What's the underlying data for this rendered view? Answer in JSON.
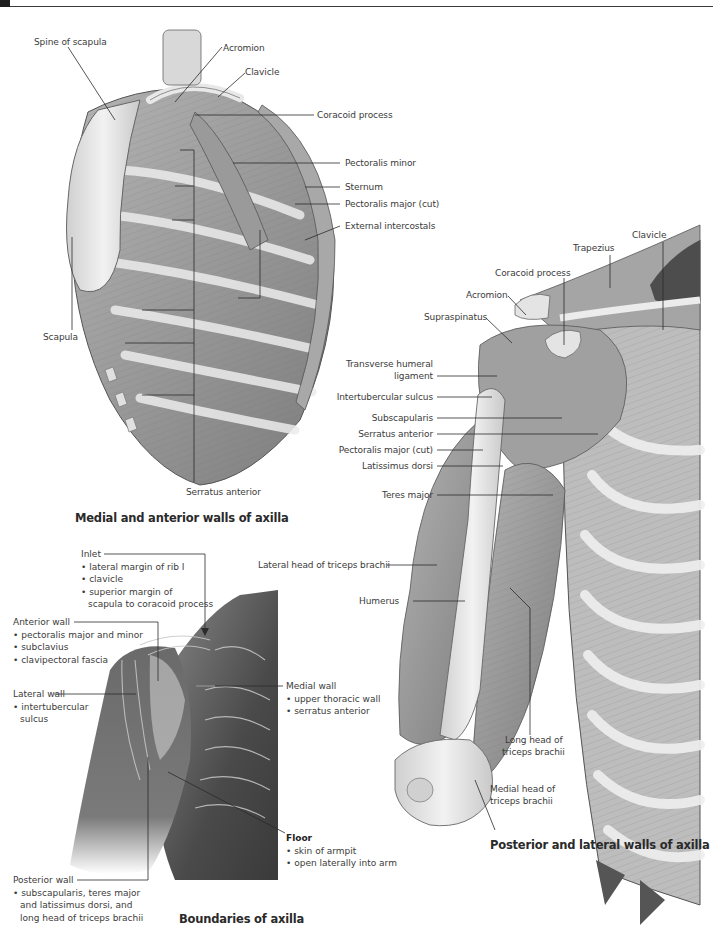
{
  "figures": [
    {
      "id": "medial-anterior",
      "caption": "Medial and anterior walls of axilla",
      "labels": {
        "spine_of_scapula": "Spine of scapula",
        "acromion": "Acromion",
        "clavicle": "Clavicle",
        "coracoid_process": "Coracoid process",
        "pectoralis_minor": "Pectoralis minor",
        "sternum": "Sternum",
        "pectoralis_major_cut": "Pectoralis major (cut)",
        "external_intercostals": "External intercostals",
        "scapula": "Scapula",
        "serratus_anterior": "Serratus anterior"
      }
    },
    {
      "id": "posterior-lateral",
      "caption": "Posterior and lateral walls of axilla",
      "labels": {
        "trapezius": "Trapezius",
        "clavicle": "Clavicle",
        "coracoid_process": "Coracoid process",
        "acromion": "Acromion",
        "supraspinatus": "Supraspinatus",
        "transverse_humeral_ligament_1": "Transverse humeral",
        "transverse_humeral_ligament_2": "ligament",
        "intertubercular_sulcus": "Intertubercular sulcus",
        "subscapularis": "Subscapularis",
        "serratus_anterior": "Serratus anterior",
        "pectoralis_major_cut": "Pectoralis major (cut)",
        "latissimus_dorsi": "Latissimus dorsi",
        "teres_major": "Teres major",
        "lateral_head_triceps": "Lateral head of triceps brachii",
        "humerus": "Humerus",
        "long_head_triceps_1": "Long head of",
        "long_head_triceps_2": "triceps brachii",
        "medial_head_triceps_1": "Medial head of",
        "medial_head_triceps_2": "triceps brachii"
      }
    },
    {
      "id": "boundaries",
      "caption": "Boundaries of axilla",
      "blocks": {
        "inlet": {
          "title": "Inlet",
          "items": [
            "lateral margin of rib I",
            "clavicle",
            "superior margin of"
          ],
          "continuation": "scapula to coracoid process"
        },
        "anterior_wall": {
          "title": "Anterior wall",
          "items": [
            "pectoralis major and minor",
            "subclavius",
            "clavipectoral fascia"
          ]
        },
        "lateral_wall": {
          "title": "Lateral wall",
          "items": [
            "intertubercular"
          ],
          "continuation": "sulcus"
        },
        "medial_wall": {
          "title": "Medial wall",
          "items": [
            "upper thoracic wall",
            "serratus anterior"
          ]
        },
        "floor": {
          "title": "Floor",
          "items": [
            "skin of armpit",
            "open laterally into arm"
          ]
        },
        "posterior_wall": {
          "title": "Posterior wall",
          "items": [
            "subscapularis, teres major"
          ],
          "continuation_lines": [
            "and latissimus dorsi, and",
            "long head of triceps brachii"
          ]
        }
      }
    }
  ],
  "colors": {
    "text": "#3b3b3b",
    "leader_line": "#2b2b2b",
    "bone": "#e6e6e6",
    "muscle": "#9a9a9a",
    "skin_dark": "#5a5a5a"
  }
}
